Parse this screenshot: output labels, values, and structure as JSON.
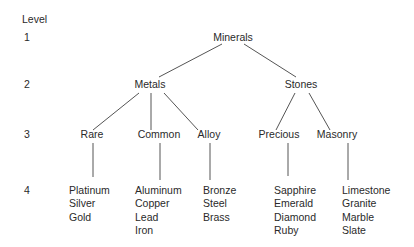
{
  "diagram": {
    "level_header": "Level",
    "levels": [
      "1",
      "2",
      "3",
      "4"
    ],
    "root": {
      "label": "Minerals",
      "children": [
        {
          "label": "Metals",
          "children": [
            {
              "label": "Rare",
              "items": [
                "Platinum",
                "Silver",
                "Gold"
              ]
            },
            {
              "label": "Common",
              "items": [
                "Aluminum",
                "Copper",
                "Lead",
                "Iron"
              ]
            },
            {
              "label": "Alloy",
              "items": [
                "Bronze",
                "Steel",
                "Brass"
              ]
            }
          ]
        },
        {
          "label": "Stones",
          "children": [
            {
              "label": "Precious",
              "items": [
                "Sapphire",
                "Emerald",
                "Diamond",
                "Ruby"
              ]
            },
            {
              "label": "Masonry",
              "items": [
                "Limestone",
                "Granite",
                "Marble",
                "Slate"
              ]
            }
          ]
        }
      ]
    }
  },
  "colors": {
    "text": "#2a2a2a",
    "lines": "#555555",
    "background": "#ffffff"
  }
}
